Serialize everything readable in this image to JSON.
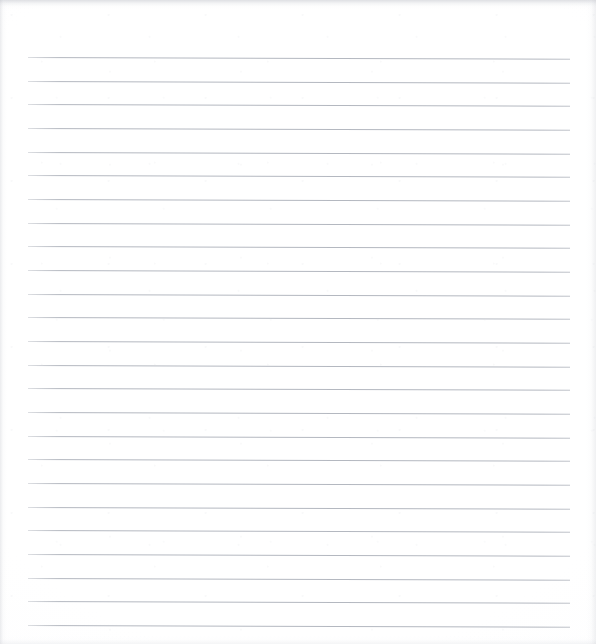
{
  "document": {
    "kind": "scanned-ruled-paper",
    "title": "Blank Ruled Notepad Sheet",
    "width_px": 596,
    "height_px": 644,
    "content_text": "",
    "has_visible_text": false,
    "has_handwriting": false,
    "orientation": "portrait"
  },
  "paper": {
    "background_color": "#ffffff",
    "tone_color": "#fafafc",
    "edge_shadow_color": "#b2b5bd",
    "grain_color": "#d6d8dc"
  },
  "ruling": {
    "line_color": "#b4b8c0",
    "line_thickness_px": 1,
    "line_count": 25,
    "left_margin_px": 28,
    "right_margin_px": 570,
    "first_line_y_px": 57,
    "line_spacing_px": 23.7,
    "skew_deg": 0.18,
    "lines": [
      {
        "index": 1,
        "y": 57,
        "x1": 28,
        "x2": 570
      },
      {
        "index": 2,
        "y": 81,
        "x1": 28,
        "x2": 570
      },
      {
        "index": 3,
        "y": 104,
        "x1": 28,
        "x2": 570
      },
      {
        "index": 4,
        "y": 128,
        "x1": 28,
        "x2": 570
      },
      {
        "index": 5,
        "y": 152,
        "x1": 28,
        "x2": 570
      },
      {
        "index": 6,
        "y": 175,
        "x1": 28,
        "x2": 570
      },
      {
        "index": 7,
        "y": 199,
        "x1": 28,
        "x2": 570
      },
      {
        "index": 8,
        "y": 223,
        "x1": 28,
        "x2": 570
      },
      {
        "index": 9,
        "y": 246,
        "x1": 28,
        "x2": 570
      },
      {
        "index": 10,
        "y": 270,
        "x1": 28,
        "x2": 570
      },
      {
        "index": 11,
        "y": 294,
        "x1": 28,
        "x2": 570
      },
      {
        "index": 12,
        "y": 317,
        "x1": 28,
        "x2": 570
      },
      {
        "index": 13,
        "y": 341,
        "x1": 28,
        "x2": 570
      },
      {
        "index": 14,
        "y": 365,
        "x1": 28,
        "x2": 570
      },
      {
        "index": 15,
        "y": 388,
        "x1": 28,
        "x2": 570
      },
      {
        "index": 16,
        "y": 412,
        "x1": 28,
        "x2": 570
      },
      {
        "index": 17,
        "y": 436,
        "x1": 28,
        "x2": 570
      },
      {
        "index": 18,
        "y": 459,
        "x1": 28,
        "x2": 570
      },
      {
        "index": 19,
        "y": 483,
        "x1": 28,
        "x2": 570
      },
      {
        "index": 20,
        "y": 507,
        "x1": 28,
        "x2": 570
      },
      {
        "index": 21,
        "y": 530,
        "x1": 28,
        "x2": 570
      },
      {
        "index": 22,
        "y": 554,
        "x1": 28,
        "x2": 570
      },
      {
        "index": 23,
        "y": 578,
        "x1": 28,
        "x2": 570
      },
      {
        "index": 24,
        "y": 601,
        "x1": 28,
        "x2": 570
      },
      {
        "index": 25,
        "y": 625,
        "x1": 28,
        "x2": 570
      }
    ]
  }
}
